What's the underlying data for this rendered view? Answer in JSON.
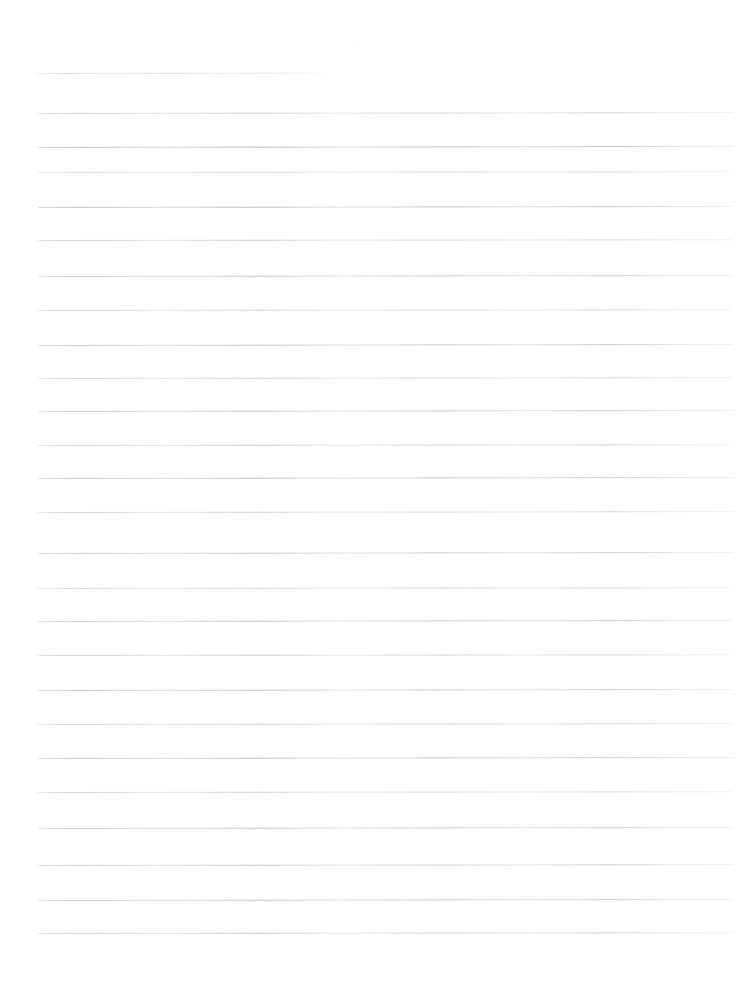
{
  "document": {
    "type": "scanned-ruled-paper",
    "title": "Blank ruled notepad page",
    "description": "A scanned blank sheet of lined notebook paper with no handwriting or printed text.",
    "page_width": 749,
    "page_height": 987,
    "background_color": "#ffffff",
    "rule_color": "#b9b9bd",
    "rule_count": 25,
    "content_text": "",
    "left_margin_x": 38,
    "right_margin_x": 733,
    "line_spacing": 35,
    "first_line_y": 73,
    "rules": [
      {
        "index": 1,
        "y": 73,
        "x1": 38,
        "x2": 331,
        "opacity": 0.55,
        "slope": -0.4,
        "short": true
      },
      {
        "index": 2,
        "y": 113,
        "x1": 38,
        "x2": 733,
        "opacity": 0.6,
        "slope": -0.9,
        "short": false
      },
      {
        "index": 3,
        "y": 147,
        "x1": 38,
        "x2": 733,
        "opacity": 0.85,
        "slope": -1.2,
        "short": false
      },
      {
        "index": 4,
        "y": 172,
        "x1": 38,
        "x2": 733,
        "opacity": 0.52,
        "slope": -0.8,
        "short": false
      },
      {
        "index": 5,
        "y": 207,
        "x1": 38,
        "x2": 733,
        "opacity": 0.78,
        "slope": -1.0,
        "short": false
      },
      {
        "index": 6,
        "y": 240,
        "x1": 38,
        "x2": 733,
        "opacity": 0.62,
        "slope": -0.7,
        "short": false
      },
      {
        "index": 7,
        "y": 276,
        "x1": 38,
        "x2": 733,
        "opacity": 0.7,
        "slope": -1.1,
        "short": false
      },
      {
        "index": 8,
        "y": 310,
        "x1": 38,
        "x2": 733,
        "opacity": 0.58,
        "slope": -0.8,
        "short": false
      },
      {
        "index": 9,
        "y": 345,
        "x1": 38,
        "x2": 733,
        "opacity": 0.74,
        "slope": -1.0,
        "short": false
      },
      {
        "index": 10,
        "y": 378,
        "x1": 38,
        "x2": 733,
        "opacity": 0.6,
        "slope": -0.9,
        "short": false
      },
      {
        "index": 11,
        "y": 411,
        "x1": 38,
        "x2": 733,
        "opacity": 0.72,
        "slope": -1.1,
        "short": false
      },
      {
        "index": 12,
        "y": 445,
        "x1": 38,
        "x2": 733,
        "opacity": 0.64,
        "slope": -0.8,
        "short": false
      },
      {
        "index": 13,
        "y": 478,
        "x1": 38,
        "x2": 733,
        "opacity": 0.76,
        "slope": -1.0,
        "short": false
      },
      {
        "index": 14,
        "y": 512,
        "x1": 38,
        "x2": 733,
        "opacity": 0.58,
        "slope": -0.9,
        "short": false
      },
      {
        "index": 15,
        "y": 553,
        "x1": 38,
        "x2": 733,
        "opacity": 0.7,
        "slope": -1.0,
        "short": false
      },
      {
        "index": 16,
        "y": 588,
        "x1": 38,
        "x2": 733,
        "opacity": 0.55,
        "slope": -0.7,
        "short": false
      },
      {
        "index": 17,
        "y": 621,
        "x1": 38,
        "x2": 733,
        "opacity": 0.72,
        "slope": -1.1,
        "short": false
      },
      {
        "index": 18,
        "y": 655,
        "x1": 38,
        "x2": 733,
        "opacity": 0.62,
        "slope": -0.8,
        "short": false
      },
      {
        "index": 19,
        "y": 690,
        "x1": 38,
        "x2": 733,
        "opacity": 0.74,
        "slope": -1.0,
        "short": false
      },
      {
        "index": 20,
        "y": 724,
        "x1": 38,
        "x2": 733,
        "opacity": 0.6,
        "slope": -0.9,
        "short": false
      },
      {
        "index": 21,
        "y": 758,
        "x1": 38,
        "x2": 733,
        "opacity": 0.76,
        "slope": -1.1,
        "short": false
      },
      {
        "index": 22,
        "y": 792,
        "x1": 38,
        "x2": 733,
        "opacity": 0.58,
        "slope": -0.8,
        "short": false
      },
      {
        "index": 23,
        "y": 828,
        "x1": 38,
        "x2": 733,
        "opacity": 0.7,
        "slope": -1.0,
        "short": false
      },
      {
        "index": 24,
        "y": 865,
        "x1": 38,
        "x2": 733,
        "opacity": 0.68,
        "slope": -0.9,
        "short": false
      },
      {
        "index": 25,
        "y": 900,
        "x1": 38,
        "x2": 733,
        "opacity": 0.72,
        "slope": -1.0,
        "short": false
      },
      {
        "index": 26,
        "y": 933,
        "x1": 38,
        "x2": 733,
        "opacity": 0.66,
        "slope": -0.8,
        "short": false
      }
    ],
    "specks": [
      {
        "x": 352,
        "y": 42,
        "size": 3,
        "opacity": 0.35
      }
    ]
  }
}
